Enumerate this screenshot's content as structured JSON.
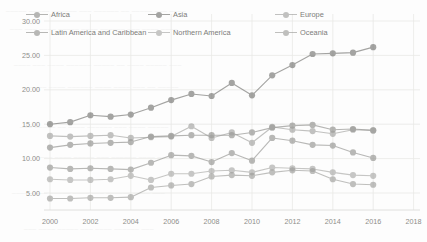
{
  "chart_data": {
    "type": "line",
    "title": "",
    "subtitle": "",
    "xlabel": "",
    "ylabel": "",
    "xlim": [
      2000,
      2018
    ],
    "ylim": [
      0,
      30
    ],
    "grid": true,
    "legend_position": "top-overlay",
    "x_ticks": [
      "2000",
      "2002",
      "2004",
      "2006",
      "2008",
      "2010",
      "2012",
      "2014",
      "2016",
      "2018"
    ],
    "y_ticks": [
      "5.00",
      "10.00",
      "15.00",
      "20.00",
      "25.00",
      "30.00"
    ],
    "x": [
      2000,
      2001,
      2002,
      2003,
      2004,
      2005,
      2006,
      2007,
      2008,
      2009,
      2010,
      2011,
      2012,
      2013,
      2014,
      2015,
      2016
    ],
    "series": [
      {
        "name": "Africa",
        "color": "#8a8a87",
        "values": [
          11.6,
          12.0,
          12.2,
          12.3,
          12.4,
          13.2,
          13.3,
          13.4,
          13.4,
          13.4,
          13.8,
          14.5,
          14.8,
          14.9,
          14.2,
          14.3,
          14.1
        ]
      },
      {
        "name": "Asia",
        "color": "#6e6e6b",
        "values": [
          15.0,
          15.3,
          16.3,
          16.1,
          16.4,
          17.4,
          18.5,
          19.4,
          19.1,
          21.0,
          19.2,
          22.1,
          23.6,
          25.2,
          25.3,
          25.4,
          26.2
        ]
      },
      {
        "name": "Europe",
        "color": "#9e9e9b",
        "values": [
          13.3,
          13.2,
          13.3,
          13.4,
          13.0,
          13.1,
          13.2,
          14.7,
          13.0,
          13.8,
          12.3,
          14.6,
          14.2,
          14.0,
          13.6,
          14.2,
          14.1
        ]
      },
      {
        "name": "Latin America and Caribbean",
        "color": "#8f8f8c",
        "values": [
          8.7,
          8.5,
          8.6,
          8.5,
          8.4,
          9.4,
          10.5,
          10.4,
          9.5,
          10.8,
          9.7,
          13.0,
          12.6,
          12.0,
          11.9,
          10.9,
          10.1
        ]
      },
      {
        "name": "Northern America",
        "color": "#a6a6a3",
        "values": [
          7.0,
          6.9,
          6.9,
          7.0,
          7.5,
          6.9,
          7.8,
          7.8,
          8.2,
          8.3,
          8.0,
          8.7,
          8.6,
          8.5,
          8.0,
          7.6,
          7.5
        ]
      },
      {
        "name": "Oceania",
        "color": "#9a9a97",
        "values": [
          4.2,
          4.2,
          4.3,
          4.3,
          4.4,
          5.8,
          6.1,
          6.3,
          7.4,
          7.6,
          7.5,
          8.0,
          8.3,
          8.2,
          7.0,
          6.3,
          6.2
        ]
      }
    ]
  },
  "legend": {
    "items": [
      {
        "label": "Africa",
        "icon": "legend-marker-icon"
      },
      {
        "label": "Asia",
        "icon": "legend-marker-icon"
      },
      {
        "label": "Europe",
        "icon": "legend-marker-icon"
      },
      {
        "label": "Latin America and Caribbean",
        "icon": "legend-marker-icon"
      },
      {
        "label": "Northern America",
        "icon": "legend-marker-icon"
      },
      {
        "label": "Oceania",
        "icon": "legend-marker-icon"
      }
    ]
  },
  "style": {
    "background": "#fdfdfd",
    "grid_color": "#e8e8e6",
    "axis_text_color": "#8d8d8a"
  }
}
